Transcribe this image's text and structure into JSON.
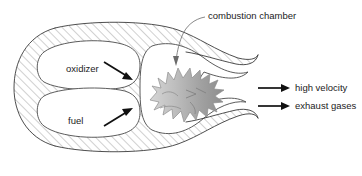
{
  "figure": {
    "background_color": "#ffffff"
  },
  "labels": {
    "combustion_chamber": "combustion  chamber",
    "oxidizer": "oxidizer",
    "fuel": "fuel",
    "high_velocity": "high velocity",
    "exhaust_gases": "exhaust gases"
  },
  "colors": {
    "outline": "#3a3a3a",
    "hatch": "#8a8a8a",
    "arrow": "#111111",
    "leader": "#6a6a6a",
    "flame_light": "#cfcfcf",
    "flame_mid": "#b4b4b4",
    "flame_dark": "#8f8f8f",
    "text": "#1c1c1c"
  },
  "icons": {
    "flow_arrow": "arrow-right-icon",
    "injector_arrow": "arrow-diagonal-icon",
    "leader_arrow": "arrow-down-icon",
    "flame": "flame-icon"
  }
}
